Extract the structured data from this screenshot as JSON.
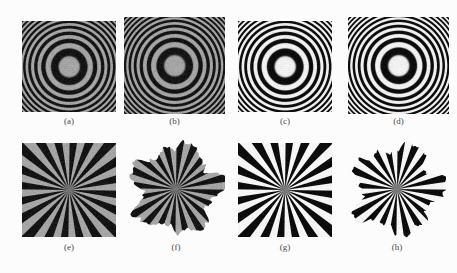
{
  "figure": {
    "background_color": "#fdfdfd",
    "label_color": "#4a4a4a",
    "rows": 2,
    "columns": 4
  },
  "panels": [
    {
      "id": "a",
      "label": "(a)",
      "pattern": "zone-plate",
      "shape": "square",
      "contrast": "low",
      "x": 22,
      "y": 21,
      "w": 94,
      "h": 91,
      "label_x": 22,
      "label_y": 116,
      "label_w": 94,
      "colors": {
        "dark": "#151515",
        "light": "#a6a6a6",
        "background": "#fdfdfd"
      },
      "rings_visible": 14,
      "chirp_rate": 0.014,
      "center_tone": "light-gray"
    },
    {
      "id": "b",
      "label": "(b)",
      "pattern": "zone-plate",
      "shape": "fractal-blob",
      "contrast": "low",
      "x": 124,
      "y": 17,
      "w": 101,
      "h": 97,
      "label_x": 124,
      "label_y": 116,
      "label_w": 101,
      "colors": {
        "dark": "#151515",
        "light": "#a6a6a6",
        "background": "#fdfdfd"
      },
      "rings_visible": 14,
      "chirp_rate": 0.014,
      "center_tone": "light-gray"
    },
    {
      "id": "c",
      "label": "(c)",
      "pattern": "zone-plate",
      "shape": "square",
      "contrast": "high",
      "x": 238,
      "y": 21,
      "w": 94,
      "h": 91,
      "label_x": 238,
      "label_y": 116,
      "label_w": 94,
      "colors": {
        "dark": "#0d0d0d",
        "light": "#f2f2f2",
        "background": "#fdfdfd"
      },
      "rings_visible": 14,
      "chirp_rate": 0.014,
      "center_tone": "white"
    },
    {
      "id": "d",
      "label": "(d)",
      "pattern": "zone-plate",
      "shape": "fractal-blob",
      "contrast": "high",
      "x": 348,
      "y": 17,
      "w": 101,
      "h": 97,
      "label_x": 348,
      "label_y": 116,
      "label_w": 101,
      "colors": {
        "dark": "#0d0d0d",
        "light": "#f2f2f2",
        "background": "#fdfdfd"
      },
      "rings_visible": 14,
      "chirp_rate": 0.014,
      "center_tone": "white"
    },
    {
      "id": "e",
      "label": "(e)",
      "pattern": "siemens-star",
      "shape": "square",
      "contrast": "low",
      "x": 22,
      "y": 143,
      "w": 94,
      "h": 94,
      "label_x": 22,
      "label_y": 242,
      "label_w": 94,
      "colors": {
        "dark": "#151515",
        "light": "#a6a6a6",
        "background": "#fdfdfd"
      },
      "spokes": 20,
      "sectors": 40
    },
    {
      "id": "f",
      "label": "(f)",
      "pattern": "siemens-star",
      "shape": "fractal-blob",
      "contrast": "low",
      "x": 127,
      "y": 140,
      "w": 98,
      "h": 98,
      "label_x": 127,
      "label_y": 242,
      "label_w": 98,
      "colors": {
        "dark": "#151515",
        "light": "#a6a6a6",
        "background": "#fdfdfd"
      },
      "spokes": 20,
      "sectors": 40
    },
    {
      "id": "g",
      "label": "(g)",
      "pattern": "siemens-star",
      "shape": "square",
      "contrast": "high",
      "x": 238,
      "y": 143,
      "w": 94,
      "h": 94,
      "label_x": 238,
      "label_y": 242,
      "label_w": 94,
      "colors": {
        "dark": "#0d0d0d",
        "light": "#f7f7f7",
        "background": "#fdfdfd"
      },
      "spokes": 20,
      "sectors": 40
    },
    {
      "id": "h",
      "label": "(h)",
      "pattern": "siemens-star",
      "shape": "fractal-blob",
      "contrast": "high",
      "x": 348,
      "y": 140,
      "w": 98,
      "h": 98,
      "label_x": 348,
      "label_y": 242,
      "label_w": 98,
      "colors": {
        "dark": "#0d0d0d",
        "light": "#f7f7f7",
        "background": "#fdfdfd"
      },
      "spokes": 20,
      "sectors": 40
    }
  ]
}
